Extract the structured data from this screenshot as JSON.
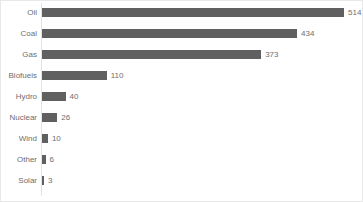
{
  "chart_data": {
    "type": "bar",
    "orientation": "horizontal",
    "title": "",
    "subtitle": "",
    "xlabel": "",
    "ylabel": "",
    "categories": [
      "Oil",
      "Coal",
      "Gas",
      "Biofuels",
      "Hydro",
      "Nuclear",
      "Wind",
      "Other",
      "Solar"
    ],
    "values": [
      514,
      434,
      373,
      110,
      40,
      26,
      10,
      6,
      3
    ],
    "value_labels": [
      "514",
      "434",
      "373",
      "110",
      "40",
      "26",
      "10",
      "6",
      "3"
    ],
    "xlim": [
      0,
      514
    ],
    "grid": false,
    "legend": false,
    "bar_color": "#606060",
    "text_color": "#6e6e6e",
    "axis_color": "#e3e3e3",
    "background": "#ffffff",
    "border_color": "#e8e8e8"
  }
}
